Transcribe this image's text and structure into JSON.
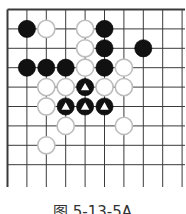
{
  "diagram": {
    "type": "go-board-partial",
    "caption": "图 5-13-5A",
    "grid": {
      "origin_x": 7.5,
      "origin_y": 9.5,
      "spacing": 19.4,
      "cols": 10,
      "rows": 10,
      "line_color": "#3a3a3a",
      "border_left": true,
      "border_top": true
    },
    "stones": [
      {
        "color": "black",
        "col": 1,
        "row": 1
      },
      {
        "color": "white",
        "col": 2,
        "row": 1
      },
      {
        "color": "white",
        "col": 4,
        "row": 1
      },
      {
        "color": "black",
        "col": 5,
        "row": 1
      },
      {
        "color": "white",
        "col": 4,
        "row": 2
      },
      {
        "color": "black",
        "col": 5,
        "row": 2
      },
      {
        "color": "black",
        "col": 7,
        "row": 2
      },
      {
        "color": "black",
        "col": 1,
        "row": 3
      },
      {
        "color": "black",
        "col": 2,
        "row": 3
      },
      {
        "color": "black",
        "col": 3,
        "row": 3
      },
      {
        "color": "white",
        "col": 4,
        "row": 3
      },
      {
        "color": "black",
        "col": 5,
        "row": 3
      },
      {
        "color": "white",
        "col": 6,
        "row": 3
      },
      {
        "color": "white",
        "col": 2,
        "row": 4
      },
      {
        "color": "white",
        "col": 3,
        "row": 4
      },
      {
        "color": "black",
        "col": 4,
        "row": 4,
        "mark": "triangle"
      },
      {
        "color": "white",
        "col": 5,
        "row": 4
      },
      {
        "color": "white",
        "col": 6,
        "row": 4
      },
      {
        "color": "white",
        "col": 2,
        "row": 5
      },
      {
        "color": "black",
        "col": 3,
        "row": 5,
        "mark": "triangle"
      },
      {
        "color": "black",
        "col": 4,
        "row": 5,
        "mark": "triangle"
      },
      {
        "color": "black",
        "col": 5,
        "row": 5,
        "mark": "triangle"
      },
      {
        "color": "white",
        "col": 3,
        "row": 6
      },
      {
        "color": "white",
        "col": 6,
        "row": 6
      },
      {
        "color": "white",
        "col": 2,
        "row": 7
      }
    ],
    "colors": {
      "black_stone": "#111111",
      "white_stone_fill": "#ffffff",
      "white_stone_stroke": "#bdbdbd",
      "triangle_mark": "#ffffff"
    }
  }
}
